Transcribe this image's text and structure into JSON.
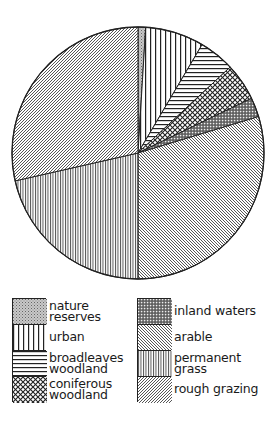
{
  "chart_data": {
    "type": "pie",
    "title": "",
    "start_angle_deg": 0,
    "direction": "clockwise",
    "center": [
      138,
      153
    ],
    "radius": 126,
    "slices": [
      {
        "key": "nature_reserves",
        "label": "nature reserves",
        "percent": 1.0,
        "pattern": "dots-fine",
        "start_deg": 0.0,
        "end_deg": 3.5
      },
      {
        "key": "urban",
        "label": "urban",
        "percent": 7.5,
        "pattern": "vertical-lines",
        "start_deg": 3.5,
        "end_deg": 30.6
      },
      {
        "key": "broadleaves_woodland",
        "label": "broadleaves woodland",
        "percent": 4.6,
        "pattern": "horizontal-lines",
        "start_deg": 30.6,
        "end_deg": 47.0
      },
      {
        "key": "coniferous_woodland",
        "label": "coniferous woodland",
        "percent": 4.8,
        "pattern": "crosshatch",
        "start_deg": 47.0,
        "end_deg": 64.3
      },
      {
        "key": "inland_waters",
        "label": "inland waters",
        "percent": 2.5,
        "pattern": "dense-crosshatch",
        "start_deg": 64.3,
        "end_deg": 73.2
      },
      {
        "key": "arable",
        "label": "arable",
        "percent": 29.7,
        "pattern": "diagonal-back",
        "start_deg": 73.2,
        "end_deg": 180.0
      },
      {
        "key": "permanent_grass",
        "label": "permanent grass",
        "percent": 21.4,
        "pattern": "fine-vertical",
        "start_deg": 180.0,
        "end_deg": 257.2
      },
      {
        "key": "rough_grazing",
        "label": "rough grazing",
        "percent": 28.6,
        "pattern": "diagonal-forward",
        "start_deg": 257.2,
        "end_deg": 360.0
      }
    ],
    "legend_position": "bottom"
  },
  "legend": {
    "left": [
      {
        "label": "nature\nreserves",
        "pattern": "dots-fine"
      },
      {
        "label": "urban",
        "pattern": "vertical-lines"
      },
      {
        "label": "broadleaves\nwoodland",
        "pattern": "horizontal-lines"
      },
      {
        "label": "coniferous\nwoodland",
        "pattern": "crosshatch"
      }
    ],
    "right": [
      {
        "label": "inland waters",
        "pattern": "dense-crosshatch"
      },
      {
        "label": "arable",
        "pattern": "diagonal-back"
      },
      {
        "label": "permanent\ngrass",
        "pattern": "fine-vertical"
      },
      {
        "label": "rough grazing",
        "pattern": "diagonal-forward"
      }
    ]
  },
  "colors": {
    "ink": "#222222",
    "background": "#ffffff"
  }
}
